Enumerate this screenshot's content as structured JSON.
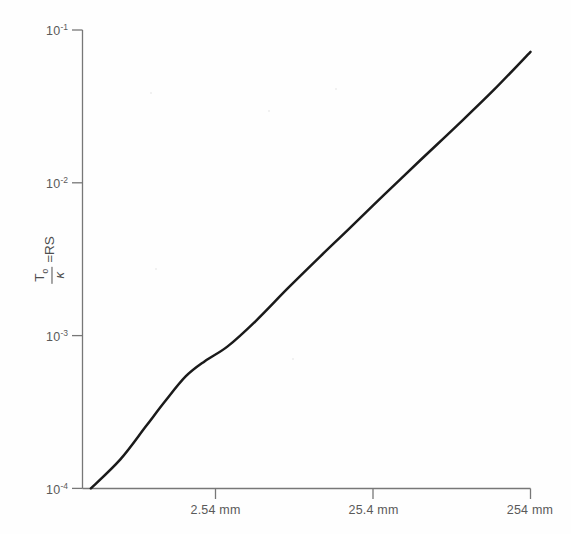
{
  "chart_data": {
    "type": "line",
    "title": "",
    "subtitle": "",
    "xlabel": "",
    "ylabel": "T_o/κ = RS",
    "ylabel_parts": {
      "numerator": "T",
      "numerator_sub": "o",
      "denominator": "κ",
      "equals": "=RS"
    },
    "x_scale": "log",
    "y_scale": "log",
    "grid": false,
    "legend": null,
    "x_tick_labels": [
      "2.54 mm",
      "25.4 mm",
      "254 mm"
    ],
    "x_tick_values": [
      2.54,
      25.4,
      254
    ],
    "y_tick_labels": [
      "10-1",
      "10-2",
      "10-3",
      "10-4"
    ],
    "y_tick_exponents": [
      "-1",
      "-2",
      "-3",
      "-4"
    ],
    "y_tick_values": [
      0.1,
      0.01,
      0.001,
      0.0001
    ],
    "ylim": [
      0.0001,
      0.1
    ],
    "xlim": [
      0.9,
      254
    ],
    "series": [
      {
        "name": "T_o/κ = RS",
        "color": "#1a1a1a",
        "points": [
          {
            "x": 1.0,
            "y": 0.0001
          },
          {
            "x": 1.45,
            "y": 0.000155
          },
          {
            "x": 2.0,
            "y": 0.000255
          },
          {
            "x": 2.54,
            "y": 0.00037
          },
          {
            "x": 3.3,
            "y": 0.00054
          },
          {
            "x": 4.2,
            "y": 0.00068
          },
          {
            "x": 5.6,
            "y": 0.00085
          },
          {
            "x": 8.0,
            "y": 0.00125
          },
          {
            "x": 12.0,
            "y": 0.00205
          },
          {
            "x": 18.0,
            "y": 0.0033
          },
          {
            "x": 25.4,
            "y": 0.0049
          },
          {
            "x": 40.0,
            "y": 0.0083
          },
          {
            "x": 64.0,
            "y": 0.0142
          },
          {
            "x": 100.0,
            "y": 0.0235
          },
          {
            "x": 160.0,
            "y": 0.0405
          },
          {
            "x": 254.0,
            "y": 0.072
          }
        ]
      }
    ]
  },
  "axes": {
    "y_axis_name": "y-axis-spine",
    "x_axis_name": "x-axis-spine"
  }
}
